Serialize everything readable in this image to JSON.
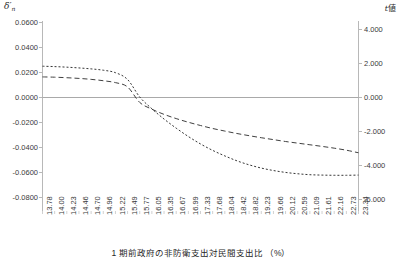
{
  "chart_data": {
    "type": "line",
    "title": "",
    "xlabel": "1 期前政府の非防衛支出対民間支出比 （%）",
    "ylabel_left": "δ'n",
    "ylabel_right": "t値",
    "grid": false,
    "legend_position": "bottom",
    "x_categories": [
      "13.78",
      "14.00",
      "14.23",
      "14.46",
      "14.70",
      "14.96",
      "15.22",
      "15.49",
      "15.77",
      "16.05",
      "16.35",
      "16.67",
      "16.99",
      "17.33",
      "17.68",
      "18.04",
      "18.42",
      "18.82",
      "19.23",
      "19.66",
      "20.12",
      "20.59",
      "21.09",
      "21.61",
      "22.16",
      "22.73",
      "23.34"
    ],
    "left_axis": {
      "label": "δ'n",
      "ticks": [
        "0.0600",
        "0.0400",
        "0.0200",
        "0.0000",
        "-0.0200",
        "-0.0400",
        "-0.0600",
        "-0.0800"
      ],
      "tick_values": [
        0.06,
        0.04,
        0.02,
        0.0,
        -0.02,
        -0.04,
        -0.06,
        -0.08
      ],
      "ylim": [
        -0.08,
        0.06
      ]
    },
    "right_axis": {
      "label": "t値",
      "ticks": [
        "4.000",
        "2.000",
        "0.000",
        "-2.000",
        "-4.000",
        "-6.000"
      ],
      "tick_values": [
        4.0,
        2.0,
        0.0,
        -2.0,
        -4.0,
        -6.0
      ],
      "ylim": [
        -6.0,
        4.0
      ]
    },
    "series": [
      {
        "name": "delta-n-coefficient",
        "axis": "left",
        "style": "dashed",
        "color": "#404040",
        "values": [
          0.0188,
          0.0186,
          0.0182,
          0.0177,
          0.017,
          0.016,
          0.0146,
          0.0114,
          0.0,
          -0.005,
          -0.0088,
          -0.0119,
          -0.0146,
          -0.017,
          -0.0192,
          -0.0211,
          -0.0229,
          -0.0245,
          -0.026,
          -0.0274,
          -0.0288,
          -0.03,
          -0.0312,
          -0.0324,
          -0.0337,
          -0.0352,
          -0.0371
        ]
      },
      {
        "name": "t-value",
        "axis": "right",
        "style": "dotted",
        "color": "#353535",
        "values": [
          1.62,
          1.6,
          1.57,
          1.53,
          1.48,
          1.41,
          1.28,
          0.92,
          0.0,
          -0.62,
          -1.16,
          -1.64,
          -2.08,
          -2.47,
          -2.81,
          -3.1,
          -3.36,
          -3.57,
          -3.74,
          -3.87,
          -3.97,
          -4.04,
          -4.09,
          -4.11,
          -4.12,
          -4.12,
          -4.11
        ]
      }
    ],
    "zero_line": true
  },
  "legend": {
    "items": [
      "",
      ""
    ]
  }
}
